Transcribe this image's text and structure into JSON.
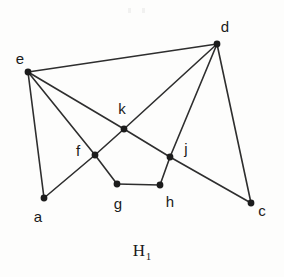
{
  "figure": {
    "caption_base": "H",
    "caption_subscript": "1",
    "caption_full": "H1",
    "background_color": "#fdfdfc",
    "ink_color": "#2e2e2e",
    "width": 284,
    "height": 277
  },
  "graph": {
    "type": "undirected-graph-drawing",
    "vertex_count": 9,
    "edge_count": 14,
    "vertices": [
      {
        "id": "a",
        "label": "a",
        "x": 44,
        "y": 198,
        "label_x": 38,
        "label_y": 216,
        "degree": 2
      },
      {
        "id": "c",
        "label": "c",
        "x": 251,
        "y": 203,
        "label_x": 262,
        "label_y": 210,
        "degree": 2
      },
      {
        "id": "d",
        "label": "d",
        "x": 217,
        "y": 44,
        "label_x": 225,
        "label_y": 26,
        "degree": 4
      },
      {
        "id": "e",
        "label": "e",
        "x": 28,
        "y": 72,
        "label_x": 20,
        "label_y": 58,
        "degree": 4
      },
      {
        "id": "f",
        "label": "f",
        "x": 95,
        "y": 155,
        "label_x": 78,
        "label_y": 150,
        "degree": 4
      },
      {
        "id": "g",
        "label": "g",
        "x": 117,
        "y": 184,
        "label_x": 118,
        "label_y": 203,
        "degree": 2
      },
      {
        "id": "h",
        "label": "h",
        "x": 160,
        "y": 185,
        "label_x": 170,
        "label_y": 201,
        "degree": 2
      },
      {
        "id": "j",
        "label": "j",
        "x": 170,
        "y": 157,
        "label_x": 186,
        "label_y": 148,
        "degree": 4
      },
      {
        "id": "k",
        "label": "k",
        "x": 124,
        "y": 129,
        "label_x": 122,
        "label_y": 108,
        "degree": 4
      }
    ],
    "edges": [
      {
        "from": "e",
        "to": "d"
      },
      {
        "from": "e",
        "to": "k"
      },
      {
        "from": "e",
        "to": "f"
      },
      {
        "from": "e",
        "to": "a"
      },
      {
        "from": "a",
        "to": "f"
      },
      {
        "from": "f",
        "to": "k"
      },
      {
        "from": "f",
        "to": "g"
      },
      {
        "from": "g",
        "to": "h"
      },
      {
        "from": "h",
        "to": "j"
      },
      {
        "from": "j",
        "to": "k"
      },
      {
        "from": "j",
        "to": "d"
      },
      {
        "from": "j",
        "to": "c"
      },
      {
        "from": "k",
        "to": "d"
      },
      {
        "from": "d",
        "to": "c"
      }
    ],
    "vertex_radius": 3.4
  }
}
